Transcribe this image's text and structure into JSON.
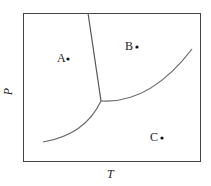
{
  "diagram": {
    "type": "phase-diagram",
    "x_axis_label": "T",
    "y_axis_label": "P",
    "points": [
      {
        "label": "A",
        "region": "left"
      },
      {
        "label": "B",
        "region": "upper-right"
      },
      {
        "label": "C",
        "region": "lower-right"
      }
    ],
    "curves": [
      "solid-liquid boundary",
      "liquid-gas boundary",
      "solid-gas boundary"
    ],
    "line_color": "#555555"
  }
}
